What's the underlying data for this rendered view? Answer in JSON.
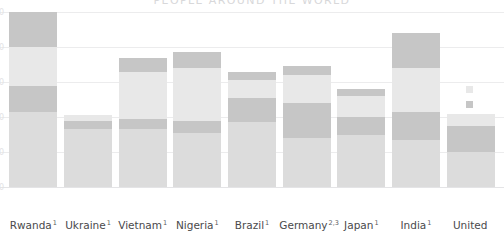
{
  "chart_data": {
    "type": "bar",
    "title": "PEOPLE AROUND THE WORLD",
    "subtitle": "",
    "xlabel": "",
    "ylabel": "",
    "stacked": true,
    "grid": true,
    "legend_position": "right",
    "ylim": [
      0,
      100
    ],
    "yticks": [
      0,
      20,
      40,
      60,
      80,
      100
    ],
    "ytick_labels": [
      "0",
      "20",
      "40",
      "60",
      "80",
      "100"
    ],
    "categories": [
      "Rwanda",
      "Ukraine",
      "Vietnam",
      "Nigeria",
      "Brazil",
      "Germany",
      "Japan",
      "India",
      "United"
    ],
    "category_footnotes": [
      "1",
      "1",
      "1",
      "1",
      "1",
      "2,3",
      "1",
      "1",
      ""
    ],
    "series": [
      {
        "name": "segment-bottom",
        "color": "#dcdcdc",
        "values": [
          43,
          33,
          33,
          31,
          37,
          28,
          30,
          27,
          20
        ]
      },
      {
        "name": "segment-middle-dark",
        "color": "#c6c6c6",
        "values": [
          15,
          5,
          6,
          7,
          14,
          20,
          10,
          16,
          15
        ]
      },
      {
        "name": "segment-upper-light",
        "color": "#e8e8e8",
        "values": [
          22,
          3,
          27,
          30,
          10,
          16,
          12,
          25,
          7
        ]
      },
      {
        "name": "segment-top-dark",
        "color": "#c6c6c6",
        "values": [
          20,
          0,
          8,
          9,
          5,
          5,
          4,
          20,
          0
        ]
      }
    ],
    "legend_entries": [
      {
        "label": "",
        "color": "#e8e8e8"
      },
      {
        "label": "",
        "color": "#c6c6c6"
      }
    ]
  },
  "axis": {
    "tick_0": "0",
    "tick_1": "20",
    "tick_2": "40",
    "tick_3": "60",
    "tick_4": "80",
    "tick_5": "100"
  },
  "labels": {
    "c0": "Rwanda",
    "f0": "1",
    "c1": "Ukraine",
    "f1": "1",
    "c2": "Vietnam",
    "f2": "1",
    "c3": "Nigeria",
    "f3": "1",
    "c4": "Brazil",
    "f4": "1",
    "c5": "Germany",
    "f5": "2,3",
    "c6": "Japan",
    "f6": "1",
    "c7": "India",
    "f7": "1",
    "c8": "United",
    "f8": ""
  },
  "title_text": "PEOPLE AROUND THE WORLD"
}
